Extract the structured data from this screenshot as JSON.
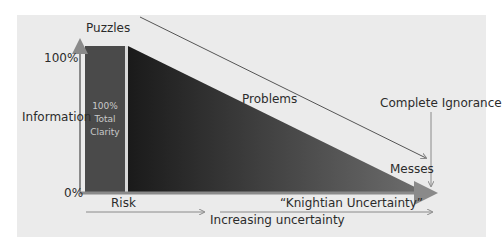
{
  "diagram": {
    "y_axis": {
      "top_label": "100%",
      "bottom_label": "0%",
      "title": "Information"
    },
    "bar": {
      "line1": "100%",
      "line2": "Total",
      "line3": "Clarity",
      "fill": "#4a4a4a"
    },
    "triangle": {
      "fill_dark": "#1e1e1e",
      "fill_light": "#6a6a6a"
    },
    "labels": {
      "puzzles": "Puzzles",
      "problems": "Problems",
      "messes": "Messes",
      "complete_ignorance": "Complete Ignorance",
      "risk": "Risk",
      "knightian": "“Knightian Uncertainty”",
      "increasing": "Increasing uncertainty"
    },
    "colors": {
      "background": "#ebebeb",
      "axis": "#8a8a8a",
      "text": "#2b2b2b"
    }
  }
}
